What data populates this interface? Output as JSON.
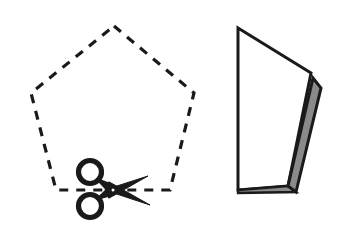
{
  "figure": {
    "title": "Cutting a dashed pentagon with scissors and the resulting folded paper piece",
    "background_color": "#ffffff",
    "ink_color": "#1a1a1a",
    "width": 341,
    "height": 236
  },
  "left_panel": {
    "name": "dashed pentagon with scissors",
    "pentagon": {
      "label": "pentagon-outline",
      "stroke_color": "#1a1a1a",
      "fill_color": "none",
      "stroke_width": 3.2,
      "line_style": "dashed",
      "dash_length": 9,
      "dash_gap": 8,
      "vertices": [
        [
          114,
          26
        ],
        [
          194,
          93
        ],
        [
          170,
          190
        ],
        [
          56,
          190
        ],
        [
          31,
          93
        ]
      ]
    },
    "scissors": {
      "label": "scissors-icon",
      "color": "#1a1a1a",
      "pivot": [
        113,
        190
      ],
      "ring_upper_center": [
        90,
        172
      ],
      "ring_lower_center": [
        90,
        206
      ],
      "ring_radius": 11.5,
      "ring_stroke_width": 5.2,
      "blade_upper_tip": [
        148,
        176
      ],
      "blade_lower_tip": [
        150,
        205
      ],
      "orientation": "blades pointing right, cutting along the bottom pentagon edge"
    }
  },
  "right_panel": {
    "name": "folded paper piece",
    "front_face": {
      "label": "white-panel",
      "fill_color": "#ffffff",
      "stroke_color": "#1a1a1a",
      "stroke_width": 3.0,
      "vertices": [
        [
          238,
          28
        ],
        [
          311,
          73
        ],
        [
          288,
          186
        ],
        [
          238,
          190
        ]
      ]
    },
    "folded_flap": {
      "label": "gray-flap",
      "fill_color": "#8a8a8a",
      "stroke_color": "#1a1a1a",
      "stroke_width": 3.0,
      "vertices": [
        [
          313,
          78
        ],
        [
          321,
          88
        ],
        [
          296,
          192
        ],
        [
          288,
          186
        ]
      ]
    },
    "bottom_sliver": {
      "label": "bottom-edge-sliver",
      "fill_color": "#8a8a8a",
      "stroke_color": "#1a1a1a",
      "stroke_width": 2.4,
      "vertices": [
        [
          238,
          190
        ],
        [
          288,
          186
        ],
        [
          296,
          192
        ],
        [
          238,
          193
        ]
      ]
    }
  }
}
